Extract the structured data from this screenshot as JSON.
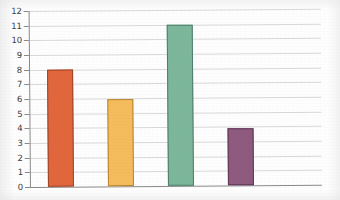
{
  "chart_data": {
    "type": "bar",
    "title": "",
    "subtitle": "",
    "xlabel": "",
    "ylabel": "",
    "categories": [
      "",
      "",
      "",
      ""
    ],
    "values": [
      8.0,
      5.9,
      10.95,
      3.9
    ],
    "series": [
      {
        "name": "",
        "values": [
          8.0,
          5.9,
          10.95,
          3.9
        ],
        "colors": [
          "#E2663C",
          "#F5BC5C",
          "#7DB79B",
          "#8E5A7E"
        ]
      }
    ],
    "ylim": [
      0,
      12
    ],
    "xlim": [
      0,
      6
    ],
    "ytick_labels": [
      "0",
      "1",
      "2",
      "3",
      "4",
      "5",
      "6",
      "7",
      "8",
      "9",
      "10",
      "11",
      "12"
    ],
    "ytick_values": [
      0,
      1,
      2,
      3,
      4,
      5,
      6,
      7,
      8,
      9,
      10,
      11,
      12
    ],
    "xtick_labels": [],
    "grid": true,
    "grid_axis": "y",
    "legend": false,
    "legend_position": "none",
    "annotations": []
  },
  "axis": {
    "y": {
      "labels": [
        {
          "text": "12",
          "value": 12
        },
        {
          "text": "11",
          "value": 11
        },
        {
          "text": "10",
          "value": 10
        },
        {
          "text": "9",
          "value": 9
        },
        {
          "text": "8",
          "value": 8
        },
        {
          "text": "7",
          "value": 7
        },
        {
          "text": "6",
          "value": 6
        },
        {
          "text": "5",
          "value": 5
        },
        {
          "text": "4",
          "value": 4
        },
        {
          "text": "3",
          "value": 3
        },
        {
          "text": "2",
          "value": 2
        },
        {
          "text": "1",
          "value": 1
        },
        {
          "text": "0",
          "value": 0
        }
      ]
    }
  },
  "bars": [
    {
      "name": "bar-1",
      "value": 8.0,
      "color": "#E2663C",
      "outline": "#9C4427"
    },
    {
      "name": "bar-2",
      "value": 5.9,
      "color": "#F5BC5C",
      "outline": "#B8842F"
    },
    {
      "name": "bar-3",
      "value": 10.95,
      "color": "#7DB79B",
      "outline": "#4E7D68"
    },
    {
      "name": "bar-4",
      "value": 3.9,
      "color": "#8E5A7E",
      "outline": "#5E3553"
    }
  ],
  "colors": {
    "background": "#FEFEFE",
    "gridline": "#D9D9D9",
    "axis": "#8A8A8A",
    "tick_label": "#3B3B3B"
  }
}
